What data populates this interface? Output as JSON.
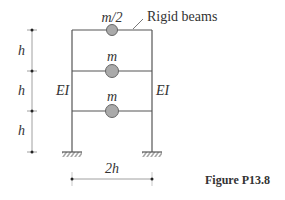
{
  "figure": {
    "caption": "Figure P13.8",
    "annotation": "Rigid beams",
    "masses": [
      {
        "label": "m/2",
        "level": 3
      },
      {
        "label": "m",
        "level": 2
      },
      {
        "label": "m",
        "level": 1
      }
    ],
    "columns": {
      "left_label": "EI",
      "right_label": "EI"
    },
    "story_heights": [
      "h",
      "h",
      "h"
    ],
    "bay_width": "2h",
    "colors": {
      "line": "#555555",
      "mass_fill": "#aaaaaa",
      "mass_stroke": "#666666"
    }
  }
}
